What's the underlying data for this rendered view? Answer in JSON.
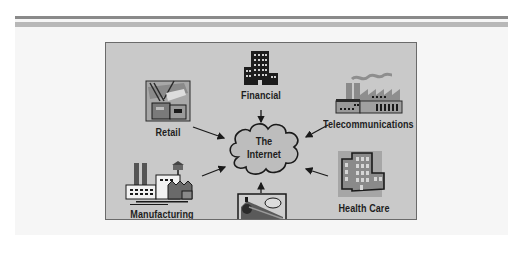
{
  "diagram": {
    "title": "",
    "center": {
      "label_line1": "The",
      "label_line2": "Internet",
      "icon": "cloud-icon"
    },
    "nodes": [
      {
        "id": "financial",
        "label": "Financial",
        "icon": "office-building-icon",
        "position": "top"
      },
      {
        "id": "retail",
        "label": "Retail",
        "icon": "retail-store-icon",
        "position": "top-left"
      },
      {
        "id": "telecommunications",
        "label": "Telecommunications",
        "icon": "factory-icon",
        "position": "top-right"
      },
      {
        "id": "manufacturing",
        "label": "Manufacturing",
        "icon": "manufacturing-plant-icon",
        "position": "bottom-left"
      },
      {
        "id": "travel",
        "label": "Travel",
        "icon": "train-icon",
        "position": "bottom"
      },
      {
        "id": "health_care",
        "label": "Health Care",
        "icon": "hospital-building-icon",
        "position": "bottom-right"
      }
    ],
    "edges": [
      {
        "from": "financial",
        "to": "internet"
      },
      {
        "from": "retail",
        "to": "internet"
      },
      {
        "from": "telecommunications",
        "to": "internet"
      },
      {
        "from": "manufacturing",
        "to": "internet"
      },
      {
        "from": "travel",
        "to": "internet"
      },
      {
        "from": "health_care",
        "to": "internet"
      }
    ],
    "colors": {
      "figure_background": "#c9c9c9",
      "figure_border": "#6a6a6a",
      "cloud_fill": "#bdbdbd",
      "text": "#1e1e1e"
    }
  }
}
